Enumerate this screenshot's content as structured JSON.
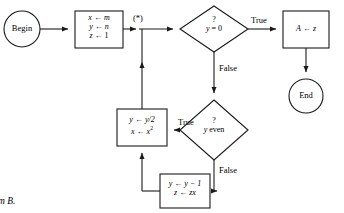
{
  "diagram": {
    "caption": "m B.",
    "junction_label": "(*)",
    "stroke_color": "#1a1a1a",
    "fill_color": "#ffffff",
    "text_color": "#000000"
  },
  "nodes": {
    "begin": {
      "label": "Begin",
      "shape": "circle"
    },
    "init": {
      "shape": "rect",
      "lines": [
        {
          "lhs": "x",
          "arrow": "←",
          "rhs": "m"
        },
        {
          "lhs": "y",
          "arrow": "←",
          "rhs": "n"
        },
        {
          "lhs": "z",
          "arrow": "←",
          "rhs": "1"
        }
      ]
    },
    "test_zero": {
      "shape": "diamond",
      "mark": "?",
      "condition_lhs": "y",
      "condition_rhs": "= 0"
    },
    "assign_a": {
      "shape": "rect",
      "lhs": "A",
      "arrow": "←",
      "rhs": "z"
    },
    "end": {
      "label": "End",
      "shape": "circle"
    },
    "test_even": {
      "shape": "diamond",
      "mark": "?",
      "condition_lhs": "y",
      "condition_rhs": "even"
    },
    "halve": {
      "shape": "rect",
      "lines": [
        {
          "lhs": "y",
          "arrow": "←",
          "rhs": "y/2"
        },
        {
          "lhs": "x",
          "arrow": "←",
          "rhs": "x",
          "exp": "2"
        }
      ]
    },
    "decrement": {
      "shape": "rect",
      "lines": [
        {
          "lhs": "y",
          "arrow": "←",
          "rhs": "y − 1"
        },
        {
          "lhs": "z",
          "arrow": "←",
          "rhs": "zx"
        }
      ]
    }
  },
  "edge_labels": {
    "zero_true": "True",
    "zero_false": "False",
    "even_true": "True",
    "even_false": "False"
  }
}
